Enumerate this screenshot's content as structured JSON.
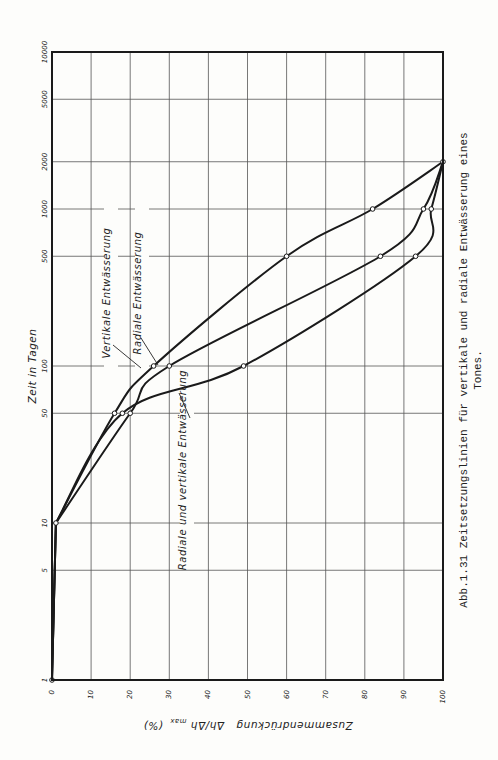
{
  "chart_data": {
    "type": "line",
    "orientation": "rotated 90° clockwise on page (x axis reads along page bottom, log time axis along page left)",
    "title": "",
    "caption": "Abb.1.31  Zeitsetzungslinien für vertikale und radiale Entwässerung eines Tones.",
    "caption_line1": "Abb.1.31  Zeitsetzungslinien für vertikale und radiale Entwässerung eines",
    "caption_line2": "Tones.",
    "xlabel": "Zusammendrückung Δh/Δh_max (%)",
    "xlabel_main": "Zusammendrückung",
    "xlabel_formula": "Δh/Δh",
    "xlabel_sub": "max",
    "xlabel_unit": "(%)",
    "ylabel": "Zeit in Tagen",
    "xlim": [
      0,
      100
    ],
    "ylim": [
      1,
      10000
    ],
    "yscale": "log",
    "grid": true,
    "x_ticks": [
      "0",
      "10",
      "20",
      "30",
      "40",
      "50",
      "60",
      "70",
      "80",
      "90",
      "100"
    ],
    "y_ticks": [
      "1",
      "5",
      "10",
      "50",
      "100",
      "500",
      "1000",
      "2000",
      "5000",
      "10000"
    ],
    "series": [
      {
        "name": "Vertikale Entwässerung",
        "points": [
          [
            0,
            1
          ],
          [
            1,
            10
          ],
          [
            16,
            50
          ],
          [
            26,
            100
          ],
          [
            60,
            500
          ],
          [
            82,
            1000
          ],
          [
            100,
            2000
          ]
        ]
      },
      {
        "name": "Radiale Entwässerung",
        "points": [
          [
            0,
            1
          ],
          [
            1,
            10
          ],
          [
            20,
            50
          ],
          [
            30,
            100
          ],
          [
            84,
            500
          ],
          [
            95,
            1000
          ],
          [
            100,
            2000
          ]
        ]
      },
      {
        "name": "Radiale und vertikale Entwässerung",
        "points": [
          [
            0,
            1
          ],
          [
            1,
            10
          ],
          [
            18,
            50
          ],
          [
            49,
            100
          ],
          [
            93,
            500
          ],
          [
            97,
            1000
          ],
          [
            100,
            2000
          ]
        ]
      }
    ],
    "markers": {
      "Vertikale Entwässerung": [
        [
          16,
          50
        ],
        [
          26,
          100
        ],
        [
          60,
          500
        ],
        [
          82,
          1000
        ]
      ],
      "Radiale Entwässerung": [
        [
          20,
          50
        ],
        [
          30,
          100
        ],
        [
          84,
          500
        ],
        [
          95,
          1000
        ]
      ],
      "Radiale und vertikale Entwässerung": [
        [
          0,
          1
        ],
        [
          1,
          10
        ],
        [
          18,
          50
        ],
        [
          49,
          100
        ],
        [
          93,
          500
        ],
        [
          97,
          1000
        ],
        [
          100,
          2000
        ]
      ]
    }
  }
}
